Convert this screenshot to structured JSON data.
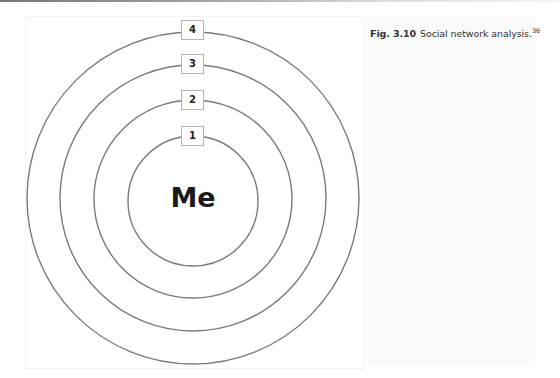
{
  "caption": {
    "figure_number": "Fig. 3.10",
    "text": "Social network analysis.",
    "reference": "36"
  },
  "diagram": {
    "center_label": "Me",
    "center": {
      "x": 193,
      "y": 198
    },
    "line_color": "#7a7a7a",
    "rings": [
      {
        "level": "1",
        "radius": 65
      },
      {
        "level": "2",
        "radius": 99
      },
      {
        "level": "3",
        "radius": 133
      },
      {
        "level": "4",
        "radius": 166
      }
    ]
  }
}
